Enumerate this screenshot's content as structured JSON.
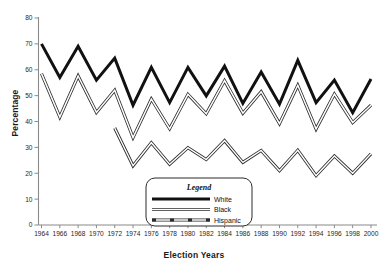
{
  "chart_data": {
    "type": "line",
    "title": "",
    "xlabel": "Election Years",
    "ylabel": "Percentage",
    "ylim": [
      0,
      80
    ],
    "ytick_step": 10,
    "grid": false,
    "legend_title": "Legend",
    "legend_position": "bottom-center",
    "categories": [
      1964,
      1966,
      1968,
      1970,
      1972,
      1974,
      1976,
      1978,
      1980,
      1982,
      1984,
      1986,
      1988,
      1990,
      1992,
      1994,
      1996,
      1998,
      2000
    ],
    "xtick_labels": [
      "1964",
      "1966",
      "1968",
      "1970",
      "1972",
      "1974",
      "1976",
      "1978",
      "1980",
      "1982",
      "1984",
      "1986",
      "1988",
      "1990",
      "1992",
      "1994",
      "1996",
      "1998",
      "2000"
    ],
    "ytick_labels": [
      "0",
      "10",
      "20",
      "30",
      "40",
      "50",
      "60",
      "70",
      "80"
    ],
    "ytick_values": [
      0,
      10,
      20,
      30,
      40,
      50,
      60,
      70,
      80
    ],
    "series": [
      {
        "name": "White",
        "style": "thick-solid-black",
        "color": "#111111",
        "values": [
          70.0,
          57.0,
          69.1,
          56.0,
          64.5,
          46.3,
          60.9,
          47.3,
          60.9,
          49.9,
          61.4,
          47.0,
          59.1,
          46.7,
          63.6,
          47.3,
          56.0,
          43.4,
          56.4
        ]
      },
      {
        "name": "Black",
        "style": "double-line-outline",
        "color": "#555555",
        "values": [
          58.5,
          41.7,
          57.6,
          43.5,
          52.1,
          33.8,
          48.7,
          37.2,
          50.5,
          43.0,
          55.8,
          43.2,
          51.5,
          39.2,
          54.0,
          37.1,
          50.6,
          39.6,
          46.3
        ]
      },
      {
        "name": "Hispanic",
        "style": "dashed-outline",
        "color": "#555555",
        "values": [
          null,
          null,
          null,
          null,
          37.5,
          22.9,
          31.8,
          23.5,
          29.9,
          25.3,
          32.6,
          24.2,
          28.8,
          21.0,
          28.9,
          19.1,
          26.7,
          20.0,
          27.5
        ]
      }
    ]
  },
  "legend": {
    "title": "Legend",
    "entries": [
      {
        "label": "White",
        "style": "thick-solid-black"
      },
      {
        "label": "Black",
        "style": "double-line-outline"
      },
      {
        "label": "Hispanic",
        "style": "dashed-outline"
      }
    ]
  },
  "axes": {
    "y_title": "Percentage",
    "x_title": "Election Years"
  }
}
